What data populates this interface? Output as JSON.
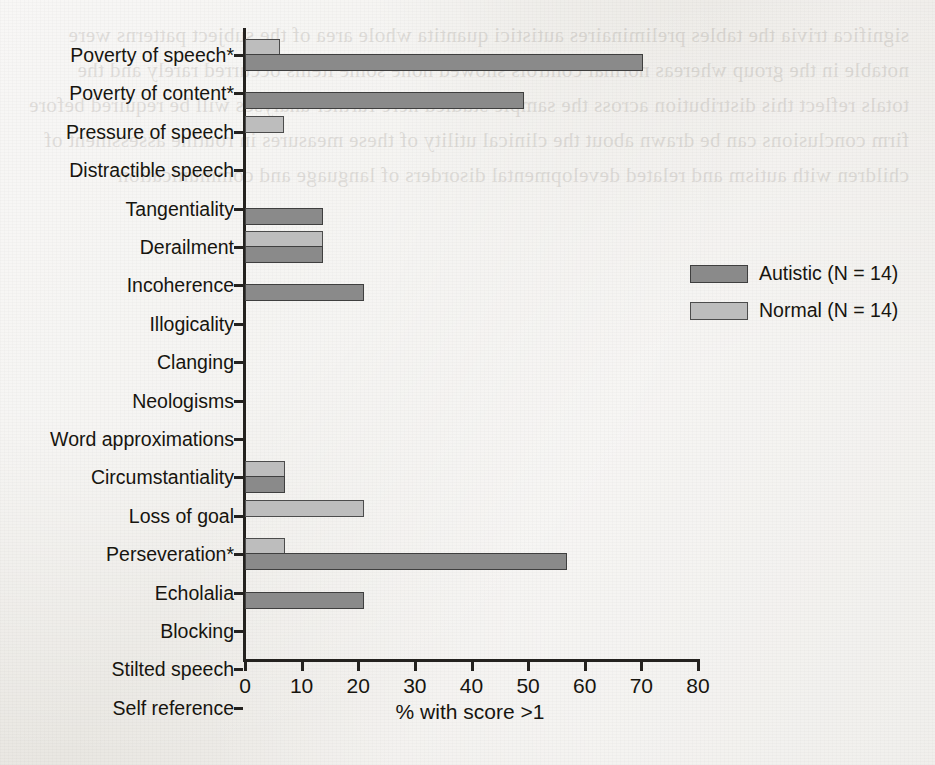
{
  "figure": {
    "background_color": "#eceae6",
    "bleed_through_text": "significa trivia the tables preliminaires autistici quantita whole area of the subject patterns were notable in the group whereas normal controls showed none some items occurred rarely and the totals reflect this distribution across the sample studied here further analyses will be required before firm conclusions can be drawn about the clinical utility of these measures in routine assessment of children with autism and related developmental disorders of language and communication",
    "axis_color": "#24221f"
  },
  "chart_data": {
    "type": "bar",
    "orientation": "horizontal",
    "title": "",
    "xlabel": "% with score >1",
    "ylabel": "",
    "xlim": [
      0,
      80
    ],
    "xticks": [
      0,
      10,
      20,
      30,
      40,
      50,
      60,
      70,
      80
    ],
    "xtick_labels": [
      "0",
      "10",
      "20",
      "30",
      "40",
      "50",
      "60",
      "70",
      "80"
    ],
    "grid": false,
    "legend_position": "right-middle",
    "categories": [
      "Poverty of speech*",
      "Poverty of content*",
      "Pressure of speech",
      "Distractible speech",
      "Tangentiality",
      "Derailment",
      "Incoherence",
      "Illogicality",
      "Clanging",
      "Neologisms",
      "Word approximations",
      "Circumstantiality",
      "Loss of goal",
      "Perseveration*",
      "Echolalia",
      "Blocking",
      "Stilted speech",
      "Self reference"
    ],
    "series": [
      {
        "name": "Autistic (N = 14)",
        "color": "#8a8a8a",
        "values": [
          70,
          49,
          0,
          0,
          13.5,
          13.5,
          20.7,
          0,
          0,
          0,
          0,
          6.7,
          0,
          56.5,
          20.7,
          0,
          0,
          0
        ]
      },
      {
        "name": "Normal (N = 14)",
        "color": "#bdbdbd",
        "values": [
          5.8,
          0,
          6.5,
          0,
          0,
          13.5,
          0,
          0,
          0,
          0,
          0,
          6.7,
          20.7,
          6.7,
          0,
          0,
          0,
          0
        ]
      }
    ]
  },
  "legend": {
    "entries": [
      {
        "label": "Autistic (N = 14)",
        "swatch": "autistic"
      },
      {
        "label": "Normal (N = 14)",
        "swatch": "normal"
      }
    ]
  }
}
